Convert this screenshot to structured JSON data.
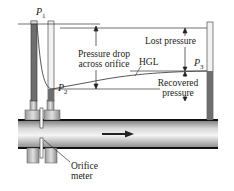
{
  "diagram": {
    "labels": {
      "p1": {
        "main": "P",
        "sub": "1"
      },
      "p2": {
        "main": "P",
        "sub": "2"
      },
      "p3": {
        "main": "P",
        "sub": "3"
      },
      "pressure_drop": [
        "Pressure drop",
        "across orifice"
      ],
      "lost_pressure": "Lost pressure",
      "hgl": "HGL",
      "recovered_pressure": [
        "Recovered",
        "pressure"
      ],
      "orifice_meter": [
        "Orifice",
        "meter"
      ]
    },
    "colors": {
      "pipe_light": "#e8e8e8",
      "pipe_dark": "#8a8a8a",
      "pipe_outline": "#111111",
      "tube_fill": "#6e6e6e",
      "tube_light": "#f2f2f2",
      "line": "#444444"
    }
  }
}
